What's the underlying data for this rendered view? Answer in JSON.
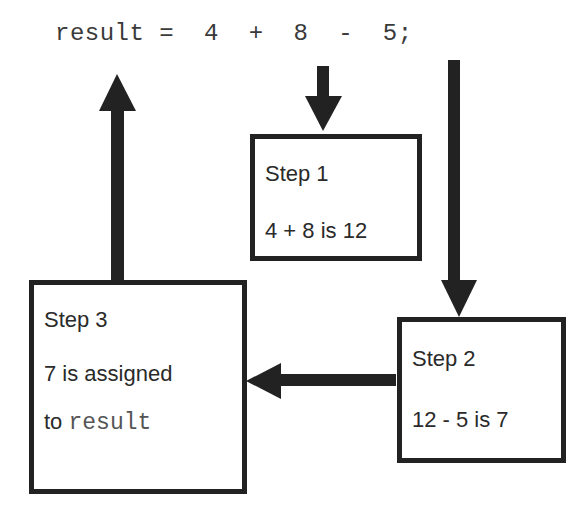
{
  "code": {
    "statement": "result =  4  +  8  -  5;"
  },
  "steps": [
    {
      "title": "Step 1",
      "lines": [
        "4 + 8 is 12"
      ]
    },
    {
      "title": "Step 2",
      "lines": [
        "12 - 5 is 7"
      ]
    },
    {
      "title": "Step 3",
      "lines": [
        "7 is assigned",
        "to "
      ],
      "code_word": "result"
    }
  ],
  "colors": {
    "stroke": "#222222",
    "text": "#2a2a2a"
  }
}
